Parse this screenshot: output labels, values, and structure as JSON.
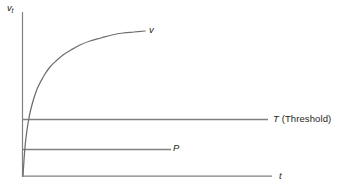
{
  "figure": {
    "width": 346,
    "height": 195,
    "background": "#ffffff",
    "line_color": "#808080",
    "text_color": "#231f20"
  },
  "labels": {
    "y_axis_symbol": "v",
    "y_axis_subscript": "t",
    "x_axis": "t",
    "curve": "v",
    "threshold_symbol": "T",
    "threshold_text": " (Threshold)",
    "priming": "P"
  },
  "chart_data": {
    "type": "line",
    "title": "",
    "xlabel": "t",
    "ylabel": "v_t",
    "grid": false,
    "legend": "none",
    "axes": {
      "x_axis": {
        "x_start": 22,
        "x_end": 272,
        "y": 176
      },
      "y_axis": {
        "x": 22,
        "y_start": 12,
        "y_end": 177
      }
    },
    "series": [
      {
        "name": "v",
        "kind": "curve",
        "description": "Saturating exponential growth curve rising from origin toward an asymptote above the threshold line",
        "label": "v",
        "points": [
          [
            23,
            176
          ],
          [
            23.5,
            168
          ],
          [
            24,
            160
          ],
          [
            24.6,
            152
          ],
          [
            25.3,
            144
          ],
          [
            26.2,
            136
          ],
          [
            27.3,
            128
          ],
          [
            28.6,
            120
          ],
          [
            30.2,
            112
          ],
          [
            32.2,
            104
          ],
          [
            34.6,
            96
          ],
          [
            37.5,
            88
          ],
          [
            41,
            81
          ],
          [
            45,
            74
          ],
          [
            50,
            67
          ],
          [
            56,
            61
          ],
          [
            63,
            55
          ],
          [
            71,
            50
          ],
          [
            80,
            45
          ],
          [
            90,
            41
          ],
          [
            101,
            38
          ],
          [
            112,
            35
          ],
          [
            123,
            33
          ],
          [
            134,
            32
          ],
          [
            145,
            31
          ]
        ]
      },
      {
        "name": "T",
        "kind": "horizontal-line",
        "label": "T (Threshold)",
        "y_value": 119,
        "x_start": 22,
        "x_end": 268
      },
      {
        "name": "P",
        "kind": "horizontal-line",
        "label": "P",
        "y_value": 149,
        "x_start": 22,
        "x_end": 171
      }
    ]
  }
}
